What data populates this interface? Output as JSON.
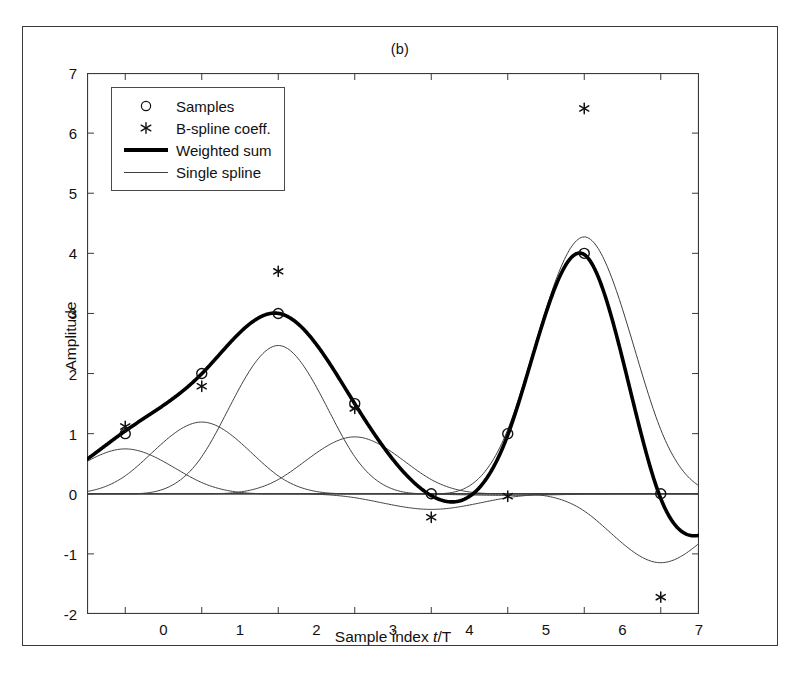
{
  "figure": {
    "title": "(b)",
    "background": "#ffffff",
    "border_color": "#3a3a3a"
  },
  "axes": {
    "y_title": "Amplitude",
    "x_title_prefix": "Sample index ",
    "x_title_italic": "t",
    "x_title_suffix": "/T",
    "x_ticks": [
      "0",
      "1",
      "2",
      "3",
      "4",
      "5",
      "6",
      "7"
    ],
    "y_ticks": [
      "7",
      "6",
      "5",
      "4",
      "3",
      "2",
      "1",
      "0",
      "-1",
      "-2"
    ]
  },
  "legend": {
    "items": [
      {
        "label": "Samples",
        "key": "circle-marker"
      },
      {
        "label": "B-spline coeff.",
        "key": "asterisk-marker"
      },
      {
        "label": "Weighted sum",
        "key": "thick-line"
      },
      {
        "label": "Single spline",
        "key": "thin-line"
      }
    ]
  },
  "chart_data": {
    "type": "line",
    "title": "(b)",
    "xlabel": "Sample index t/T",
    "ylabel": "Amplitude",
    "xlim": [
      -0.5,
      7.5
    ],
    "ylim": [
      -2,
      7
    ],
    "xticks": [
      0,
      1,
      2,
      3,
      4,
      5,
      6,
      7
    ],
    "yticks": [
      -2,
      -1,
      0,
      1,
      2,
      3,
      4,
      5,
      6,
      7
    ],
    "grid": false,
    "legend_position": "upper left",
    "series": [
      {
        "name": "Samples",
        "type": "scatter",
        "marker": "circle",
        "color": "#111111",
        "x": [
          0,
          1,
          2,
          3,
          4,
          5,
          6,
          7
        ],
        "values": [
          1.0,
          2.0,
          3.0,
          1.5,
          0.0,
          1.0,
          4.0,
          0.0
        ]
      },
      {
        "name": "B-spline coeff.",
        "type": "scatter",
        "marker": "asterisk",
        "color": "#111111",
        "x": [
          0,
          1,
          2,
          3,
          4,
          5,
          6,
          7
        ],
        "values": [
          1.12,
          1.79,
          3.7,
          1.42,
          -0.39,
          -0.04,
          6.41,
          -1.72
        ]
      },
      {
        "name": "Weighted sum",
        "type": "line",
        "linewidth": "thick",
        "color": "#000000",
        "description": "Cubic B-spline interpolation passing through all sample circles",
        "x": [
          -0.5,
          -0.25,
          0.0,
          0.25,
          0.5,
          0.75,
          1.0,
          1.25,
          1.5,
          1.75,
          2.0,
          2.25,
          2.5,
          2.75,
          3.0,
          3.25,
          3.5,
          3.75,
          4.0,
          4.25,
          4.5,
          4.75,
          5.0,
          5.25,
          5.5,
          5.75,
          6.0,
          6.25,
          6.5,
          6.75,
          7.0,
          7.25,
          7.5
        ],
        "values": [
          0.47,
          0.72,
          1.0,
          1.3,
          1.58,
          1.82,
          2.0,
          2.2,
          2.51,
          2.82,
          3.0,
          2.93,
          2.59,
          2.08,
          1.5,
          0.95,
          0.5,
          0.17,
          0.0,
          -0.12,
          -0.08,
          0.25,
          1.0,
          1.97,
          2.95,
          3.75,
          4.0,
          3.6,
          2.55,
          1.2,
          0.0,
          -0.42,
          -0.52
        ]
      },
      {
        "name": "Single spline",
        "type": "line",
        "linewidth": "thin",
        "color": "#3f3f3f",
        "description": "Individual scaled cubic B-spline basis functions, one per coefficient",
        "basis_peaks": [
          0.75,
          1.19,
          2.45,
          0.94,
          -0.26,
          -0.03,
          4.25,
          -1.19
        ],
        "basis_centers": [
          0,
          1,
          2,
          3,
          4,
          5,
          6,
          7
        ],
        "basis_scales": [
          1.12,
          1.79,
          3.7,
          1.42,
          -0.39,
          -0.04,
          6.41,
          -1.72
        ]
      }
    ]
  }
}
